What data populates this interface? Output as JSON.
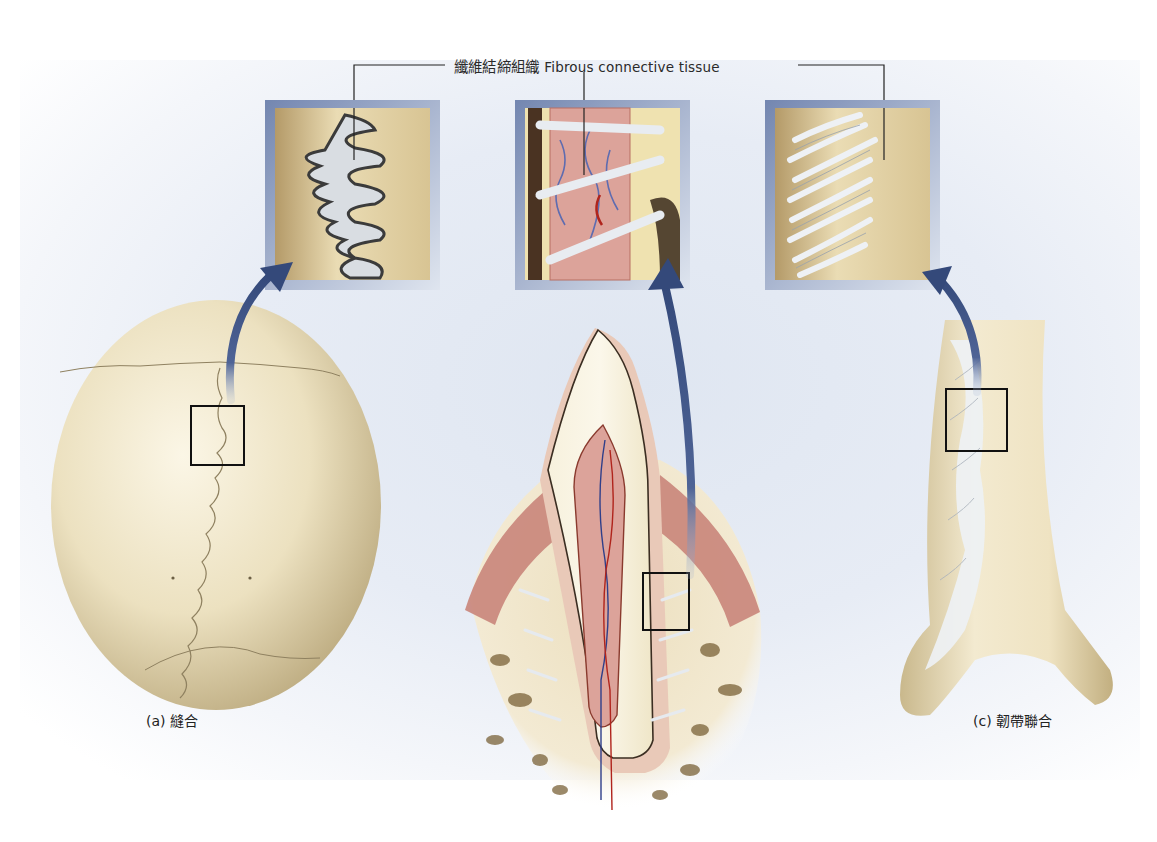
{
  "figure": {
    "callout": {
      "label_zh": "纖維結締組織",
      "label_en": "Fibrous connective tissue"
    },
    "panels": [
      {
        "id": "a",
        "caption": "(a) 縫合",
        "subject": "skull-suture"
      },
      {
        "id": "b",
        "caption": "",
        "subject": "tooth-gomphosis"
      },
      {
        "id": "c",
        "caption": "(c) 韌帶聯合",
        "subject": "tibia-fibula-syndesmosis"
      }
    ],
    "colors": {
      "bone": "#e8dcb8",
      "bone_shadow": "#bfae83",
      "inset_frame": "#7e8fb5",
      "arrow": "#3d5587",
      "fiber": "#e9edf2",
      "gum": "#c9857a",
      "pulp": "#dca39a",
      "background_tint": "#e3e9f3"
    }
  }
}
